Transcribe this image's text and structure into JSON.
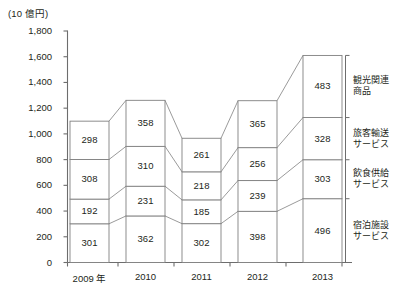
{
  "chart_data": {
    "type": "bar",
    "stacked": true,
    "title": "",
    "subtitle": "",
    "unit_label": "(10 億円)",
    "xlabel": "",
    "ylabel": "",
    "categories": [
      "2009 年",
      "2010",
      "2011",
      "2012",
      "2013"
    ],
    "ylim": [
      0,
      1800
    ],
    "ytick_labels": [
      "0",
      "200",
      "400",
      "600",
      "800",
      "1,000",
      "1,200",
      "1,400",
      "1,600",
      "1,800"
    ],
    "ytick_values": [
      0,
      200,
      400,
      600,
      800,
      1000,
      1200,
      1400,
      1600,
      1800
    ],
    "grid": false,
    "legend_position": "right",
    "connector_bands": true,
    "series": [
      {
        "name": "宿泊施設サービス",
        "legend_line1": "宿泊施設",
        "legend_line2": "サービス",
        "values": [
          301,
          362,
          302,
          398,
          496
        ]
      },
      {
        "name": "飲食供給サービス",
        "legend_line1": "飲食供給",
        "legend_line2": "サービス",
        "values": [
          192,
          231,
          185,
          239,
          303
        ]
      },
      {
        "name": "旅客輸送サービス",
        "legend_line1": "旅客輸送",
        "legend_line2": "サービス",
        "values": [
          308,
          310,
          218,
          256,
          328
        ]
      },
      {
        "name": "観光関連商品",
        "legend_line1": "観光関連",
        "legend_line2": "商品",
        "values": [
          298,
          358,
          261,
          365,
          483
        ]
      }
    ],
    "totals": [
      1099,
      1261,
      966,
      1258,
      1610
    ],
    "colors": {
      "bar_fill": "#ffffff",
      "bar_stroke": "#808080",
      "axis": "#6d6d6d",
      "text": "#231f20"
    }
  }
}
